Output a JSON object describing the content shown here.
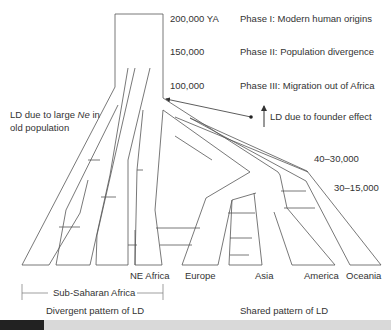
{
  "figure": {
    "time_labels": [
      {
        "text": "200,000 YA",
        "x": 170,
        "y": 18
      },
      {
        "text": "150,000",
        "x": 170,
        "y": 51
      },
      {
        "text": "100,000",
        "x": 170,
        "y": 83
      },
      {
        "text": "40–30,000",
        "x": 322,
        "y": 154
      },
      {
        "text": "30–15,000",
        "x": 336,
        "y": 185
      }
    ],
    "phase_labels": [
      {
        "text": "Phase I: Modern human origins",
        "x": 240,
        "y": 18
      },
      {
        "text": "Phase II: Population divergence",
        "x": 240,
        "y": 51
      },
      {
        "text": "Phase III: Migration out of Africa",
        "x": 240,
        "y": 83
      }
    ],
    "annotations": {
      "large_ne_line1_pre": "LD due to large ",
      "large_ne_italic": "Ne",
      "large_ne_line1_post": " in",
      "large_ne_line2": "old population",
      "founder_effect": "LD due to founder effect"
    },
    "populations": [
      "NE Africa",
      "Europe",
      "Asia",
      "America",
      "Oceania"
    ],
    "bracket_label": "Sub-Saharan Africa",
    "footer_left": "Divergent pattern of LD",
    "footer_right": "Shared pattern of LD",
    "colors": {
      "line": "#555555",
      "text": "#333333",
      "bar_dark": "#222222",
      "bar_light": "#d9d9d9"
    }
  }
}
